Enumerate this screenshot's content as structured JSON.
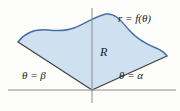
{
  "figure": {
    "labels": {
      "curve": "r = f(θ)",
      "region": "R",
      "left_ray": "θ = β",
      "right_ray": "θ = α"
    },
    "colors": {
      "background": "#fdfdfc",
      "region_fill": "#cfe0f0",
      "curve_stroke": "#4a6fa8",
      "ray_stroke": "#3c3c3c",
      "axis_stroke": "#8c8c8c"
    },
    "geometry": {
      "origin": [
        92,
        90
      ],
      "leftmost_point": [
        18,
        42
      ],
      "rightmost_point": [
        167,
        56
      ],
      "peak_point": [
        106,
        14
      ],
      "x_axis_y": 90,
      "y_axis_x": 92,
      "x_axis_extent": [
        8,
        176
      ],
      "y_axis_extent": [
        8,
        103
      ]
    }
  }
}
